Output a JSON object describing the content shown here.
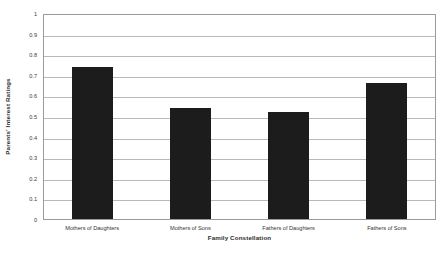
{
  "chart_data": {
    "type": "bar",
    "title": "",
    "subtitle": "",
    "xlabel": "Family Constellation",
    "ylabel": "Parents' Interest Ratings",
    "categories": [
      "Mothers of Daughters",
      "Mothers of Sons",
      "Fathers of Daughters",
      "Fathers of Sons"
    ],
    "values": [
      0.74,
      0.54,
      0.52,
      0.66
    ],
    "ylim": [
      0,
      1
    ],
    "ytick_labels": [
      "1",
      "0.9",
      "0.8",
      "0.7",
      "0.6",
      "0.5",
      "0.4",
      "0.3",
      "0.2",
      "0.1",
      "0"
    ],
    "ytick_values": [
      1,
      0.9,
      0.8,
      0.7,
      0.6,
      0.5,
      0.4,
      0.3,
      0.2,
      0.1,
      0
    ],
    "grid": true,
    "grid_axis": "y",
    "legend": false,
    "legend_position": "none",
    "bar_color": "#1c1c1c",
    "grid_color": "#b9b9b9",
    "frame_color": "#9a9a9a",
    "background_color": "#ffffff"
  }
}
